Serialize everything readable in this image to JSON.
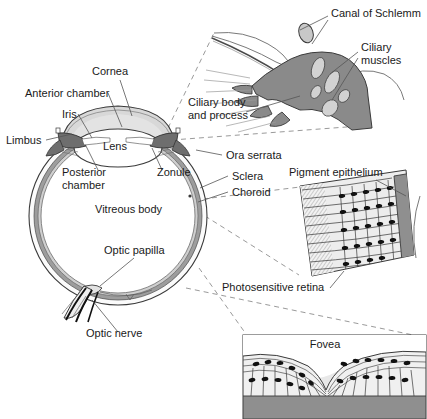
{
  "figure": {
    "width": 427,
    "height": 419,
    "background": "#ffffff"
  },
  "colors": {
    "outline": "#3a3a3a",
    "leader_line": "#555555",
    "dashed_connector": "#9a9a9a",
    "text": "#1a1a1a",
    "cornea_fill": "#d8d8d8",
    "lens_fill": "#ffffff",
    "iris_fill": "#6e6e6e",
    "sclera_fill": "#fbfbfb",
    "choroid_fill": "#9d9d9d",
    "retina_fill": "#cfcfcf",
    "vitreous_fill": "#ffffff",
    "ciliary_body_fill": "#8a8a8a",
    "ciliary_muscle_fill": "#d2d2d2",
    "pigment_epithelium_fill": "#8f8f8f",
    "retina_inset_fill": "#ededed",
    "fovea_inset_fill": "#e8e8e8",
    "nerve_cell_fill": "#111111"
  },
  "main_diagram": {
    "name": "sagittal-section-of-eyeball",
    "labels": [
      {
        "id": "cornea",
        "text": "Cornea",
        "x": 92,
        "y": 75,
        "anchor": "start"
      },
      {
        "id": "anterior-chamber",
        "text": "Anterior chamber",
        "x": 25,
        "y": 97,
        "anchor": "start"
      },
      {
        "id": "iris",
        "text": "Iris",
        "x": 62,
        "y": 118,
        "anchor": "start"
      },
      {
        "id": "limbus",
        "text": "Limbus",
        "x": 6,
        "y": 144,
        "anchor": "start"
      },
      {
        "id": "lens",
        "text": "Lens",
        "x": 115,
        "y": 150,
        "anchor": "middle"
      },
      {
        "id": "posterior-chamber-1",
        "text": "Posterior",
        "x": 62,
        "y": 176,
        "anchor": "start"
      },
      {
        "id": "posterior-chamber-2",
        "text": "chamber",
        "x": 62,
        "y": 189,
        "anchor": "start"
      },
      {
        "id": "zonule",
        "text": "Zonule",
        "x": 157,
        "y": 176,
        "anchor": "start"
      },
      {
        "id": "vitreous-body",
        "text": "Vitreous body",
        "x": 95,
        "y": 213,
        "anchor": "start"
      },
      {
        "id": "optic-papilla",
        "text": "Optic papilla",
        "x": 104,
        "y": 254,
        "anchor": "start"
      },
      {
        "id": "optic-nerve",
        "text": "Optic nerve",
        "x": 86,
        "y": 337,
        "anchor": "start"
      },
      {
        "id": "ora-serrata",
        "text": "Ora serrata",
        "x": 226,
        "y": 159,
        "anchor": "start"
      },
      {
        "id": "sclera",
        "text": "Sclera",
        "x": 232,
        "y": 180,
        "anchor": "start"
      },
      {
        "id": "choroid",
        "text": "Choroid",
        "x": 232,
        "y": 196,
        "anchor": "start"
      }
    ]
  },
  "inset_ciliary": {
    "name": "ciliary-body-detail",
    "labels": [
      {
        "id": "canal-of-schlemm",
        "text": "Canal of Schlemm",
        "x": 331,
        "y": 17,
        "anchor": "start"
      },
      {
        "id": "ciliary-muscles-1",
        "text": "Ciliary",
        "x": 361,
        "y": 51,
        "anchor": "start"
      },
      {
        "id": "ciliary-muscles-2",
        "text": "muscles",
        "x": 361,
        "y": 64,
        "anchor": "start"
      },
      {
        "id": "ciliary-body-1",
        "text": "Ciliary body",
        "x": 188,
        "y": 106,
        "anchor": "start"
      },
      {
        "id": "ciliary-body-2",
        "text": "and process",
        "x": 188,
        "y": 119,
        "anchor": "start"
      }
    ]
  },
  "inset_retina": {
    "name": "photosensitive-retina-detail",
    "labels": [
      {
        "id": "pigment-epithelium",
        "text": "Pigment epithelium",
        "x": 289,
        "y": 176,
        "anchor": "start"
      },
      {
        "id": "photosensitive-retina",
        "text": "Photosensitive retina",
        "x": 222,
        "y": 291,
        "anchor": "start"
      }
    ]
  },
  "inset_fovea": {
    "name": "fovea-detail",
    "labels": [
      {
        "id": "fovea",
        "text": "Fovea",
        "x": 325,
        "y": 348,
        "anchor": "middle"
      }
    ]
  }
}
